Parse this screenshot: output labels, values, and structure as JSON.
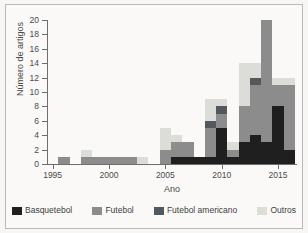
{
  "chart_data": {
    "type": "bar",
    "subtype": "stacked-bar",
    "title": "",
    "xlabel": "Ano",
    "ylabel": "Número de artigos",
    "xlim": [
      1994.5,
      2016.5
    ],
    "ylim": [
      0,
      20
    ],
    "ytick_values": [
      0,
      2,
      4,
      6,
      8,
      10,
      12,
      14,
      16,
      18,
      20
    ],
    "ytick_labels": [
      "0",
      "2",
      "4",
      "6",
      "8",
      "10",
      "12",
      "14",
      "16",
      "18",
      "20"
    ],
    "xtick_values": [
      1995,
      2000,
      2005,
      2010,
      2015
    ],
    "xtick_labels": [
      "1995",
      "2000",
      "2005",
      "2010",
      "2015"
    ],
    "grid": false,
    "legend_position": "bottom",
    "categories": [
      1996,
      1997,
      1998,
      1999,
      2000,
      2001,
      2002,
      2003,
      2004,
      2005,
      2006,
      2007,
      2008,
      2009,
      2010,
      2011,
      2012,
      2013,
      2014,
      2015,
      2016
    ],
    "series": [
      {
        "name": "Basquetebol",
        "color": "#1f1f1f",
        "values": [
          0,
          0,
          0,
          0,
          0,
          0,
          0,
          0,
          0,
          0,
          1,
          1,
          1,
          1,
          5,
          1,
          3,
          4,
          3,
          8,
          2
        ]
      },
      {
        "name": "Futebol",
        "color": "#8c8c8c",
        "values": [
          1,
          0,
          1,
          1,
          1,
          1,
          1,
          0,
          0,
          2,
          2,
          2,
          0,
          4,
          2,
          1,
          5,
          7,
          17,
          3,
          9
        ]
      },
      {
        "name": "Futebol americano",
        "color": "#52585e",
        "values": [
          0,
          0,
          0,
          0,
          0,
          0,
          0,
          0,
          0,
          0,
          0,
          0,
          0,
          1,
          1,
          0,
          0,
          1,
          0,
          0,
          0
        ]
      },
      {
        "name": "Outros",
        "color": "#dcdcd8",
        "values": [
          0,
          0,
          1,
          0,
          0,
          0,
          0,
          1,
          0,
          3,
          1,
          0,
          0,
          3,
          1,
          1,
          6,
          2,
          0,
          1,
          1
        ]
      }
    ],
    "totals": [
      1,
      0,
      2,
      1,
      1,
      1,
      1,
      1,
      0,
      5,
      4,
      3,
      1,
      9,
      9,
      3,
      14,
      14,
      20,
      12,
      12
    ]
  },
  "legend": {
    "items": [
      {
        "label": "Basquetebol",
        "color": "#1f1f1f"
      },
      {
        "label": "Futebol",
        "color": "#8c8c8c"
      },
      {
        "label": "Futebol americano",
        "color": "#52585e"
      },
      {
        "label": "Outros",
        "color": "#dcdcd8"
      }
    ]
  }
}
